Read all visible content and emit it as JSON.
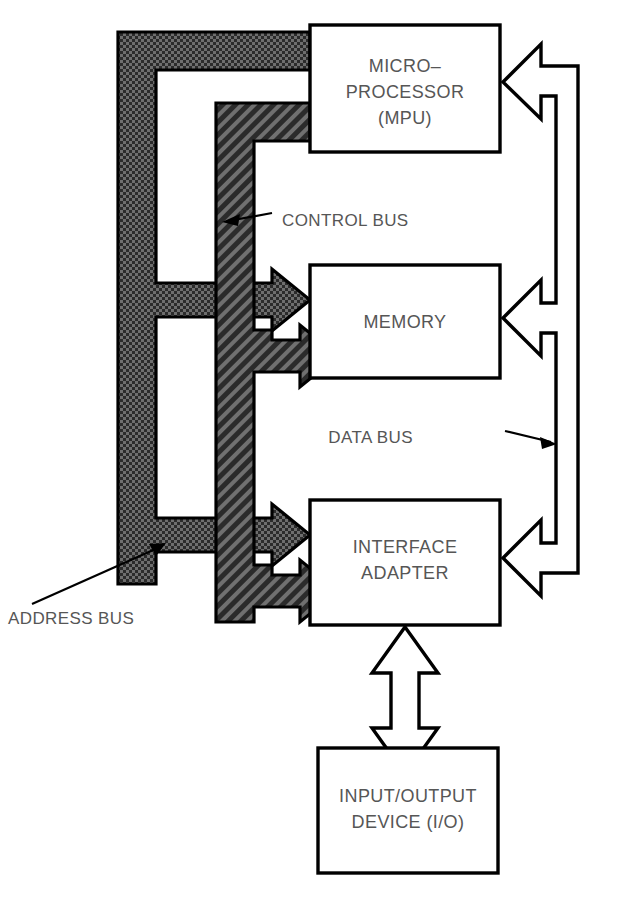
{
  "diagram": {
    "background_color": "#ffffff",
    "line_color": "#000000",
    "text_color": "#565656",
    "blocks": [
      {
        "id": "mpu",
        "name": "microprocessor-block",
        "lines": [
          "MICRO–",
          "PROCESSOR",
          "(MPU)"
        ],
        "x": 310,
        "y": 25,
        "width": 190,
        "height": 127,
        "fill": "#ffffff"
      },
      {
        "id": "memory",
        "name": "memory-block",
        "lines": [
          "MEMORY"
        ],
        "x": 310,
        "y": 265,
        "width": 190,
        "height": 113,
        "fill": "#ffffff"
      },
      {
        "id": "interface",
        "name": "interface-adapter-block",
        "lines": [
          "INTERFACE",
          "ADAPTER"
        ],
        "x": 310,
        "y": 500,
        "width": 190,
        "height": 125,
        "fill": "#ffffff"
      },
      {
        "id": "io",
        "name": "io-device-block",
        "lines": [
          "INPUT/OUTPUT",
          "DEVICE (I/O)"
        ],
        "x": 318,
        "y": 748,
        "width": 180,
        "height": 125,
        "fill": "#ffffff"
      }
    ],
    "buses": [
      {
        "id": "address-bus",
        "name": "address-bus",
        "label": "ADDRESS BUS",
        "style": "stipple",
        "color": "#3c3c3c",
        "label_x": 10,
        "label_y": 620,
        "pointer_from_x": 32,
        "pointer_from_y": 604,
        "pointer_to_x": 165,
        "pointer_to_y": 543
      },
      {
        "id": "control-bus",
        "name": "control-bus",
        "label": "CONTROL BUS",
        "style": "hatch",
        "color": "#3c3c3c",
        "label_x": 282,
        "label_y": 226,
        "pointer_from_x": 272,
        "pointer_from_y": 213,
        "pointer_to_x": 224,
        "pointer_to_y": 222
      },
      {
        "id": "data-bus",
        "name": "data-bus",
        "label": "DATA BUS",
        "style": "outline",
        "color": "#ffffff",
        "label_x": 413,
        "label_y": 443,
        "pointer_from_x": 505,
        "pointer_from_y": 431,
        "pointer_to_x": 556,
        "pointer_to_y": 444
      }
    ],
    "io_connector": {
      "name": "io-bidirectional-arrow",
      "style": "outline",
      "direction": "bidirectional"
    }
  }
}
